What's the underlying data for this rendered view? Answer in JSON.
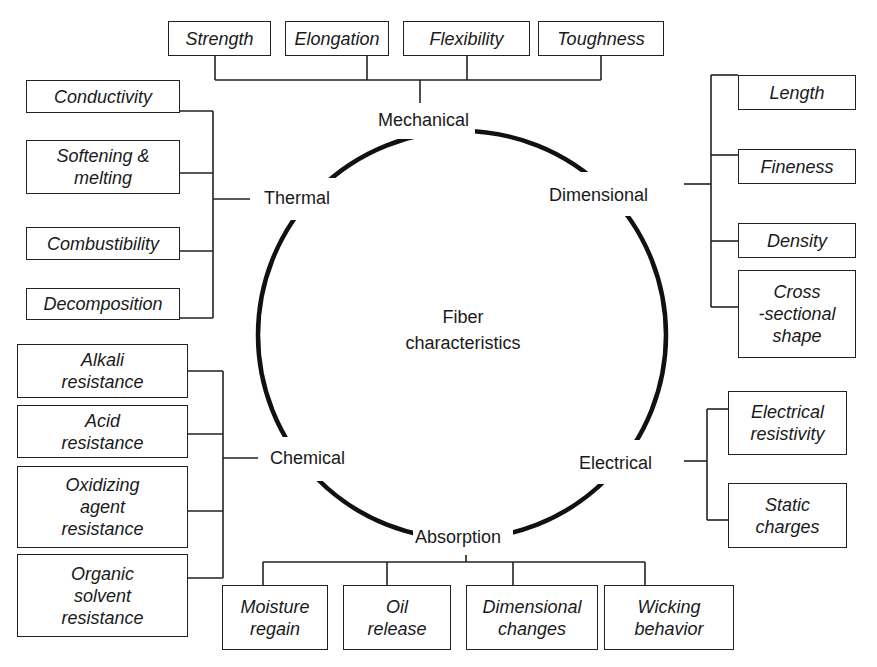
{
  "diagram": {
    "center": {
      "line1": "Fiber",
      "line2": "characteristics"
    },
    "categories": {
      "mechanical": {
        "label": "Mechanical",
        "items": [
          "Strength",
          "Elongation",
          "Flexibility",
          "Toughness"
        ]
      },
      "thermal": {
        "label": "Thermal",
        "items": [
          "Conductivity",
          "Softening &\nmelting",
          "Combustibility",
          "Decomposition"
        ]
      },
      "dimensional": {
        "label": "Dimensional",
        "items": [
          "Length",
          "Fineness",
          "Density",
          "Cross\n-sectional\nshape"
        ]
      },
      "chemical": {
        "label": "Chemical",
        "items": [
          "Alkali\nresistance",
          "Acid\nresistance",
          "Oxidizing\nagent\nresistance",
          "Organic\nsolvent\nresistance"
        ]
      },
      "electrical": {
        "label": "Electrical",
        "items": [
          "Electrical\nresistivity",
          "Static\ncharges"
        ]
      },
      "absorption": {
        "label": "Absorption",
        "items": [
          "Moisture\nregain",
          "Oil\nrelease",
          "Dimensional\nchanges",
          "Wicking\nbehavior"
        ]
      }
    },
    "colors": {
      "line": "#1a1a1a",
      "background": "#ffffff"
    }
  }
}
